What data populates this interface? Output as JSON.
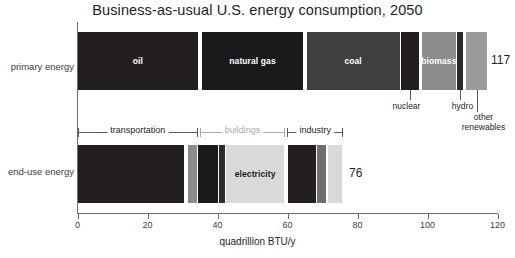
{
  "chart_data": {
    "type": "bar",
    "orientation": "horizontal",
    "title": "Business-as-usual U.S. energy consumption, 2050",
    "xlabel": "quadrillion BTU/y",
    "ylabel": "",
    "xlim": [
      0,
      120
    ],
    "xticks": [
      0,
      20,
      40,
      60,
      80,
      100,
      120
    ],
    "xtick_labels": [
      "0",
      "20",
      "40",
      "60",
      "80",
      "100",
      "120"
    ],
    "grid": false,
    "legend": "none",
    "categories": [
      "primary energy",
      "end-use energy"
    ],
    "totals": [
      117,
      76
    ],
    "total_labels": [
      "117",
      "76"
    ],
    "series": [
      {
        "name": "primary energy",
        "row_label": "primary energy",
        "total": 117,
        "total_label": "117",
        "segments": [
          {
            "label": "oil",
            "value": 34.5,
            "start": 0.0,
            "color": "#231f20",
            "label_shown": true,
            "label_color": "light"
          },
          {
            "label": "natural gas",
            "value": 29.0,
            "start": 35.5,
            "color": "#1a1a1a",
            "label_shown": true,
            "label_color": "light"
          },
          {
            "label": "coal",
            "value": 26.5,
            "start": 65.5,
            "color": "#3f3f3f",
            "label_shown": true,
            "label_color": "light"
          },
          {
            "label": "nuclear",
            "value": 5.0,
            "start": 92.5,
            "color": "#231f20",
            "label_shown": false,
            "callout": true
          },
          {
            "label": "biomass",
            "value": 9.5,
            "start": 98.5,
            "color": "#8c8c8c",
            "label_shown": true,
            "label_color": "light"
          },
          {
            "label": "hydro",
            "value": 1.7,
            "start": 108.5,
            "color": "#2b2b2b",
            "label_shown": false,
            "callout": true
          },
          {
            "label": "other renewables",
            "value": 6.0,
            "start": 111.0,
            "color": "#9b9b9b",
            "label_shown": false,
            "callout": true
          }
        ]
      },
      {
        "name": "end-use energy",
        "row_label": "end-use energy",
        "total": 76,
        "total_label": "76",
        "segments": [
          {
            "label": "transportation-liquid",
            "value": 30.5,
            "start": 0.0,
            "color": "#231f20",
            "label_shown": false
          },
          {
            "label": "transportation-gas",
            "value": 2.5,
            "start": 31.5,
            "color": "#8c8c8c",
            "label_shown": false
          },
          {
            "label": "transportation-other",
            "value": 5.5,
            "start": 34.5,
            "color": "#1a1a1a",
            "label_shown": false
          },
          {
            "label": "buildings-fuel",
            "value": 1.5,
            "start": 40.5,
            "color": "#2b2b2b",
            "label_shown": false
          },
          {
            "label": "electricity",
            "value": 16.5,
            "start": 42.5,
            "color": "#d9d9d9",
            "label_shown": true,
            "label_color": "dark"
          },
          {
            "label": "industry-fuel",
            "value": 8.0,
            "start": 60.0,
            "color": "#231f20",
            "label_shown": false
          },
          {
            "label": "industry-gas",
            "value": 2.5,
            "start": 68.5,
            "color": "#6e6e6e",
            "label_shown": false
          },
          {
            "label": "industry-electricity",
            "value": 4.0,
            "start": 71.5,
            "color": "#d9d9d9",
            "label_shown": false
          }
        ]
      }
    ],
    "callouts": [
      {
        "name": "nuclear",
        "label": "nuclear",
        "anchor_value": 95.0,
        "text_value": 94.0
      },
      {
        "name": "hydro",
        "label": "hydro",
        "anchor_value": 109.3,
        "text_value": 110.0
      },
      {
        "name": "other-renewables",
        "label": "other renewables",
        "anchor_value": 114.0,
        "text_value": 116.0,
        "lines": [
          "other",
          "renewables"
        ]
      }
    ],
    "brackets": [
      {
        "name": "transportation",
        "label": "transportation",
        "start": 0.0,
        "end": 34.4,
        "style": "dark"
      },
      {
        "name": "buildings",
        "label": "buildings",
        "start": 35.0,
        "end": 59.3,
        "style": "gray"
      },
      {
        "name": "industry",
        "label": "industry",
        "start": 59.8,
        "end": 76.0,
        "style": "dark"
      }
    ]
  },
  "colors": {
    "oil": "#231f20",
    "natural_gas": "#1a1a1a",
    "coal": "#3f3f3f",
    "nuclear": "#231f20",
    "biomass": "#8c8c8c",
    "hydro": "#2b2b2b",
    "other_renewables": "#9b9b9b",
    "electricity": "#d9d9d9",
    "axis": "#6d6d6d",
    "text": "#231f20",
    "muted_text": "#a7a9ac",
    "background": "#ffffff"
  }
}
